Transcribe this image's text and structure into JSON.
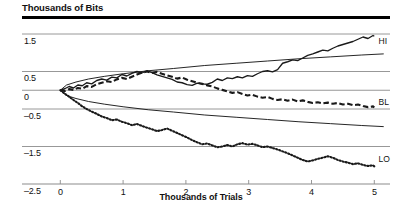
{
  "chart_data": {
    "type": "line",
    "title": "Thousands of Bits",
    "xlabel": "Thousands of Trials",
    "ylabel": "Thousands of Bits",
    "grid": true,
    "legend_position": "inline-right",
    "xlim": [
      -0.18,
      5.25
    ],
    "ylim": [
      -2.5,
      1.9
    ],
    "xticks": [
      "0",
      "1",
      "2",
      "3",
      "4",
      "5"
    ],
    "xtick_values": [
      0,
      1,
      2,
      3,
      4,
      5
    ],
    "yticks": [
      "1.5",
      "0.5",
      "0",
      "–0.5",
      "–1.5",
      "–2.5"
    ],
    "ytick_values": [
      1.5,
      0.5,
      0,
      -0.5,
      -1.5,
      -2.5
    ],
    "annotations": [
      {
        "text": "HI",
        "x": 5.05,
        "y": 1.32
      },
      {
        "text": "BL",
        "x": 5.05,
        "y": -0.3
      },
      {
        "text": "LO",
        "x": 5.05,
        "y": -1.82
      }
    ],
    "series": [
      {
        "name": "HI",
        "style": "solid",
        "label": "HI",
        "x": [
          0,
          0.07,
          0.14,
          0.21,
          0.28,
          0.35,
          0.42,
          0.5,
          0.58,
          0.66,
          0.74,
          0.82,
          0.9,
          0.98,
          1.06,
          1.14,
          1.22,
          1.3,
          1.38,
          1.46,
          1.54,
          1.62,
          1.7,
          1.78,
          1.86,
          1.94,
          2.02,
          2.1,
          2.18,
          2.26,
          2.34,
          2.42,
          2.5,
          2.58,
          2.66,
          2.74,
          2.82,
          2.9,
          2.98,
          3.06,
          3.14,
          3.22,
          3.3,
          3.38,
          3.46,
          3.54,
          3.62,
          3.7,
          3.78,
          3.86,
          3.94,
          4.02,
          4.1,
          4.18,
          4.26,
          4.34,
          4.42,
          4.5,
          4.58,
          4.66,
          4.74,
          4.82,
          4.9,
          4.98,
          5.0
        ],
        "y": [
          0,
          0.04,
          0.1,
          0.06,
          0.14,
          0.12,
          0.2,
          0.17,
          0.26,
          0.3,
          0.27,
          0.35,
          0.33,
          0.42,
          0.38,
          0.45,
          0.5,
          0.46,
          0.52,
          0.47,
          0.41,
          0.37,
          0.33,
          0.29,
          0.22,
          0.2,
          0.15,
          0.13,
          0.19,
          0.17,
          0.16,
          0.21,
          0.3,
          0.26,
          0.33,
          0.31,
          0.36,
          0.33,
          0.39,
          0.37,
          0.44,
          0.5,
          0.52,
          0.49,
          0.55,
          0.72,
          0.76,
          0.81,
          0.79,
          0.86,
          0.93,
          0.97,
          1.02,
          1.07,
          1.05,
          1.12,
          1.18,
          1.22,
          1.26,
          1.3,
          1.36,
          1.42,
          1.38,
          1.46,
          1.44
        ]
      },
      {
        "name": "BL",
        "style": "dashed",
        "label": "BL",
        "x": [
          0,
          0.07,
          0.14,
          0.21,
          0.28,
          0.35,
          0.42,
          0.5,
          0.58,
          0.66,
          0.74,
          0.82,
          0.9,
          0.98,
          1.06,
          1.14,
          1.22,
          1.3,
          1.38,
          1.46,
          1.54,
          1.62,
          1.7,
          1.78,
          1.86,
          1.94,
          2.02,
          2.1,
          2.18,
          2.26,
          2.34,
          2.42,
          2.5,
          2.58,
          2.66,
          2.74,
          2.82,
          2.9,
          2.98,
          3.06,
          3.14,
          3.22,
          3.3,
          3.38,
          3.46,
          3.54,
          3.62,
          3.7,
          3.78,
          3.86,
          3.94,
          4.02,
          4.1,
          4.18,
          4.26,
          4.34,
          4.42,
          4.5,
          4.58,
          4.66,
          4.74,
          4.82,
          4.9,
          4.98,
          5.0
        ],
        "y": [
          0,
          -0.02,
          0.03,
          0.01,
          0.06,
          0.04,
          0.11,
          0.09,
          0.16,
          0.2,
          0.24,
          0.22,
          0.29,
          0.33,
          0.3,
          0.36,
          0.42,
          0.47,
          0.5,
          0.46,
          0.49,
          0.44,
          0.4,
          0.36,
          0.31,
          0.34,
          0.28,
          0.24,
          0.2,
          0.17,
          0.13,
          0.1,
          0.05,
          0.01,
          -0.03,
          -0.07,
          -0.05,
          -0.1,
          -0.14,
          -0.12,
          -0.17,
          -0.2,
          -0.18,
          -0.23,
          -0.26,
          -0.24,
          -0.28,
          -0.25,
          -0.3,
          -0.27,
          -0.31,
          -0.34,
          -0.32,
          -0.35,
          -0.33,
          -0.36,
          -0.34,
          -0.38,
          -0.36,
          -0.4,
          -0.38,
          -0.42,
          -0.45,
          -0.43,
          -0.46
        ]
      },
      {
        "name": "LO",
        "style": "dotted",
        "label": "LO",
        "x": [
          0,
          0.07,
          0.14,
          0.21,
          0.28,
          0.35,
          0.42,
          0.5,
          0.58,
          0.66,
          0.74,
          0.82,
          0.9,
          0.98,
          1.06,
          1.14,
          1.22,
          1.3,
          1.38,
          1.46,
          1.54,
          1.62,
          1.7,
          1.78,
          1.86,
          1.94,
          2.02,
          2.1,
          2.18,
          2.26,
          2.34,
          2.42,
          2.5,
          2.58,
          2.66,
          2.74,
          2.82,
          2.9,
          2.98,
          3.06,
          3.14,
          3.22,
          3.3,
          3.38,
          3.46,
          3.54,
          3.62,
          3.7,
          3.78,
          3.86,
          3.94,
          4.02,
          4.1,
          4.18,
          4.26,
          4.34,
          4.42,
          4.5,
          4.58,
          4.66,
          4.74,
          4.82,
          4.9,
          4.98,
          5.0
        ],
        "y": [
          0,
          -0.09,
          -0.17,
          -0.26,
          -0.34,
          -0.43,
          -0.5,
          -0.57,
          -0.63,
          -0.7,
          -0.74,
          -0.8,
          -0.78,
          -0.84,
          -0.88,
          -0.93,
          -0.9,
          -0.95,
          -1.0,
          -1.04,
          -1.09,
          -1.06,
          -1.02,
          -1.08,
          -1.14,
          -1.2,
          -1.26,
          -1.33,
          -1.39,
          -1.44,
          -1.42,
          -1.47,
          -1.52,
          -1.5,
          -1.46,
          -1.5,
          -1.44,
          -1.41,
          -1.45,
          -1.43,
          -1.47,
          -1.52,
          -1.5,
          -1.54,
          -1.58,
          -1.63,
          -1.68,
          -1.74,
          -1.8,
          -1.86,
          -1.9,
          -1.87,
          -1.83,
          -1.8,
          -1.76,
          -1.8,
          -1.86,
          -1.9,
          -1.93,
          -1.97,
          -1.95,
          -1.99,
          -2.02,
          -2.0,
          -2.03
        ]
      },
      {
        "name": "upper-envelope",
        "style": "envelope",
        "label": "",
        "x": [
          0,
          0.1,
          0.25,
          0.45,
          0.7,
          1.0,
          1.4,
          1.8,
          2.3,
          2.8,
          3.3,
          3.8,
          4.3,
          4.8,
          5.15
        ],
        "y": [
          0,
          0.14,
          0.22,
          0.3,
          0.37,
          0.44,
          0.52,
          0.58,
          0.66,
          0.72,
          0.78,
          0.84,
          0.89,
          0.94,
          0.97
        ]
      },
      {
        "name": "lower-envelope",
        "style": "envelope",
        "label": "",
        "x": [
          0,
          0.1,
          0.25,
          0.45,
          0.7,
          1.0,
          1.4,
          1.8,
          2.3,
          2.8,
          3.3,
          3.8,
          4.3,
          4.8,
          5.15
        ],
        "y": [
          0,
          -0.14,
          -0.22,
          -0.3,
          -0.37,
          -0.44,
          -0.52,
          -0.58,
          -0.66,
          -0.72,
          -0.78,
          -0.84,
          -0.89,
          -0.94,
          -0.97
        ]
      }
    ],
    "colors": {
      "series_line": "#1a1a1a",
      "gridline": "#8c8c8c",
      "axis_rule": "#000000",
      "text": "#111111",
      "background": "#ffffff"
    }
  }
}
